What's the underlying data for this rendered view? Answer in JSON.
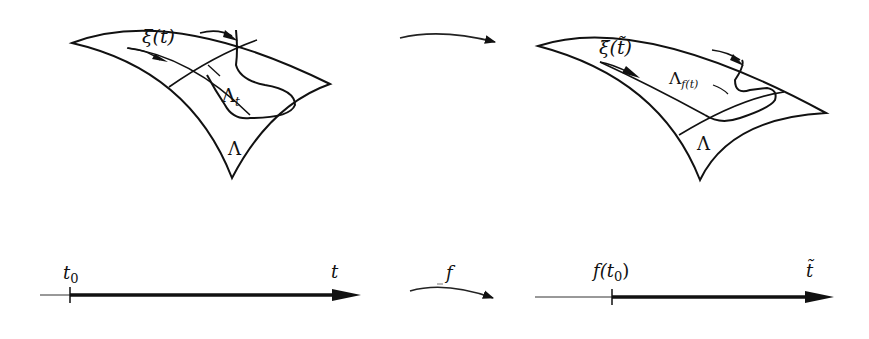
{
  "colors": {
    "ink": "#111111",
    "background": "#ffffff"
  },
  "left_surface": {
    "curve_label": "ξ(t)",
    "region_label": "Λ",
    "region_subscript": "t",
    "surface_label": "Λ"
  },
  "right_surface": {
    "curve_label": "ξ̃(t̃)",
    "region_label": "Λ",
    "region_subscript": "f(t)",
    "surface_label": "Λ"
  },
  "top_map_arrow": {
    "label": ""
  },
  "left_axis": {
    "start_label": "t",
    "start_subscript": "0",
    "end_label": "t"
  },
  "bottom_map_arrow": {
    "label": "f"
  },
  "right_axis": {
    "start_label": "f(t",
    "start_subscript": "0",
    "start_close": ")",
    "end_label": "t̃"
  }
}
